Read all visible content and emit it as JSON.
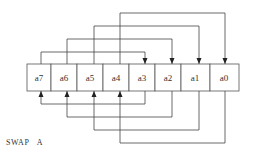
{
  "diagram": {
    "caption_parts": [
      "SWAP",
      "A"
    ],
    "register": {
      "cells": [
        "a7",
        "a6",
        "a5",
        "a4",
        "a3",
        "a2",
        "a1",
        "a0"
      ]
    },
    "mappings_top": [
      {
        "from": "a7",
        "to": "a3"
      },
      {
        "from": "a6",
        "to": "a2"
      },
      {
        "from": "a5",
        "to": "a1"
      },
      {
        "from": "a4",
        "to": "a0"
      }
    ],
    "mappings_bottom": [
      {
        "from": "a3",
        "to": "a7"
      },
      {
        "from": "a2",
        "to": "a6"
      },
      {
        "from": "a1",
        "to": "a5"
      },
      {
        "from": "a0",
        "to": "a4"
      }
    ],
    "colors": {
      "line": "#444444",
      "box_border": "#555555",
      "text": "#333333"
    }
  }
}
